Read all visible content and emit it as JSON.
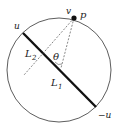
{
  "diagram": {
    "type": "geometry",
    "labels": {
      "v": "v",
      "p": "p",
      "u": "u",
      "neg_u": "−u",
      "L1": "L",
      "L1_sub": "1",
      "L2": "L",
      "L2_sub": "2",
      "theta": "θ"
    },
    "colors": {
      "circle": "#333333",
      "diameter": "#111111",
      "dashed": "#555555",
      "point": "#111111"
    }
  }
}
